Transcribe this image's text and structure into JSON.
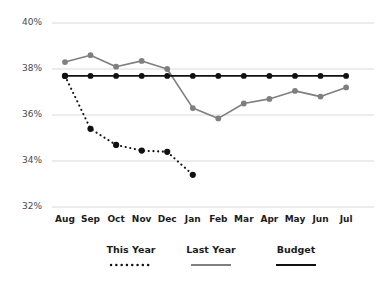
{
  "chart_data": {
    "type": "line",
    "title": "",
    "subtitle": "",
    "xlabel": "",
    "ylabel": "",
    "categories": [
      "Aug",
      "Sep",
      "Oct",
      "Nov",
      "Dec",
      "Jan",
      "Feb",
      "Mar",
      "Apr",
      "May",
      "Jun",
      "Jul"
    ],
    "ylim": [
      32,
      40
    ],
    "yticks": [
      32,
      34,
      36,
      38,
      40
    ],
    "ytick_labels": [
      "32%",
      "34%",
      "36%",
      "38%",
      "40%"
    ],
    "grid": "horizontal",
    "legend_position": "bottom",
    "series": [
      {
        "name": "This Year",
        "style": "dotted",
        "color": "#111111",
        "marker": "circle",
        "values": [
          37.7,
          35.4,
          34.7,
          34.45,
          34.4,
          33.4,
          null,
          null,
          null,
          null,
          null,
          null
        ]
      },
      {
        "name": "Last Year",
        "style": "solid",
        "color": "#7f7f7f",
        "marker": "circle",
        "values": [
          38.3,
          38.6,
          38.1,
          38.35,
          38.0,
          36.3,
          35.85,
          36.5,
          36.7,
          37.05,
          36.8,
          37.2
        ]
      },
      {
        "name": "Budget",
        "style": "solid",
        "color": "#111111",
        "marker": "circle",
        "values": [
          37.7,
          37.7,
          37.7,
          37.7,
          37.7,
          37.7,
          37.7,
          37.7,
          37.7,
          37.7,
          37.7,
          37.7
        ]
      }
    ]
  },
  "axis": {
    "y_labels": [
      "40%",
      "38%",
      "36%",
      "34%",
      "32%"
    ],
    "x_labels": [
      "Aug",
      "Sep",
      "Oct",
      "Nov",
      "Dec",
      "Jan",
      "Feb",
      "Mar",
      "Apr",
      "May",
      "Jun",
      "Jul"
    ]
  },
  "legend": {
    "items": [
      {
        "label": "This Year",
        "color": "#111111",
        "style": "dotted"
      },
      {
        "label": "Last Year",
        "color": "#7f7f7f",
        "style": "solid"
      },
      {
        "label": "Budget",
        "color": "#111111",
        "style": "solid"
      }
    ]
  },
  "colors": {
    "this_year": "#111111",
    "last_year": "#7f7f7f",
    "budget": "#111111",
    "grid": "#d9d9d9",
    "background": "#ffffff",
    "tick_text": "#4a4a4a"
  }
}
